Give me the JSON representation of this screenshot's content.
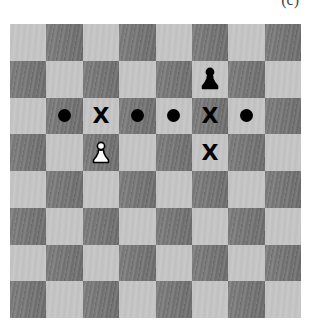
{
  "caption": "(c)",
  "board": {
    "size": 8,
    "top_left_color": "light",
    "colors": {
      "light": "#c6c6c6",
      "dark": "#7c7c7c",
      "marker": "#000000"
    }
  },
  "pieces": [
    {
      "type": "pawn",
      "color": "black",
      "row": 1,
      "col": 5
    },
    {
      "type": "pawn",
      "color": "white",
      "row": 3,
      "col": 2
    }
  ],
  "markers": [
    {
      "type": "dot",
      "row": 2,
      "col": 1
    },
    {
      "type": "x",
      "label": "X",
      "row": 2,
      "col": 2
    },
    {
      "type": "dot",
      "row": 2,
      "col": 3
    },
    {
      "type": "dot",
      "row": 2,
      "col": 4
    },
    {
      "type": "x",
      "label": "X",
      "row": 2,
      "col": 5
    },
    {
      "type": "dot",
      "row": 2,
      "col": 6
    },
    {
      "type": "x",
      "label": "X",
      "row": 3,
      "col": 5
    }
  ]
}
